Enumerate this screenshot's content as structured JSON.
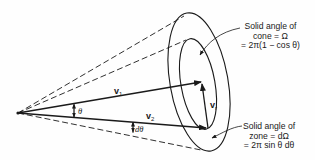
{
  "diagram": {
    "vectors": {
      "v1": {
        "symbol": "v",
        "subscript": "1"
      },
      "v2": {
        "symbol": "v",
        "subscript": "2"
      },
      "vr": {
        "symbol": "v",
        "subscript": "r"
      }
    },
    "angles": {
      "theta": "θ",
      "dtheta": "dθ"
    },
    "annotations": {
      "cone": {
        "line1": "Solid angle of",
        "line2": "cone = Ω",
        "line3": "= 2π(1 − cos θ)"
      },
      "zone": {
        "line1": "Solid angle of",
        "line2": "zone = dΩ",
        "line3": "= 2π sin θ dθ"
      }
    },
    "colors": {
      "ink": "#1a1a1a",
      "background": "#fefefe"
    }
  }
}
